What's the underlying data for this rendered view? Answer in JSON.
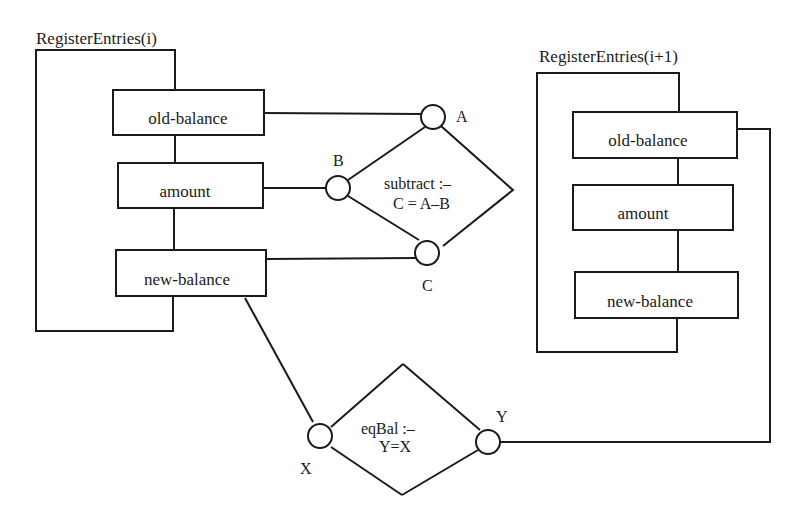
{
  "diagram": {
    "type": "constraint-network",
    "frames": [
      {
        "id": "left",
        "title": "RegisterEntries(i)",
        "fields": [
          "old-balance",
          "amount",
          "new-balance"
        ]
      },
      {
        "id": "right",
        "title": "RegisterEntries(i+1)",
        "fields": [
          "old-balance",
          "amount",
          "new-balance"
        ]
      }
    ],
    "relations": [
      {
        "id": "subtract",
        "line1": "subtract :–",
        "line2": "C = A–B",
        "ports": [
          "A",
          "B",
          "C"
        ]
      },
      {
        "id": "eqBal",
        "line1": "eqBal :–",
        "line2": "Y=X",
        "ports": [
          "X",
          "Y"
        ]
      }
    ],
    "connections": [
      {
        "from": "RegisterEntries(i).old-balance",
        "to": "subtract.A"
      },
      {
        "from": "RegisterEntries(i).amount",
        "to": "subtract.B"
      },
      {
        "from": "RegisterEntries(i).new-balance",
        "to": "subtract.C"
      },
      {
        "from": "RegisterEntries(i).new-balance",
        "to": "eqBal.X"
      },
      {
        "from": "eqBal.Y",
        "to": "RegisterEntries(i+1).old-balance"
      }
    ],
    "colors": {
      "ink": "#1a1a1a",
      "paper": "#ffffff"
    }
  }
}
